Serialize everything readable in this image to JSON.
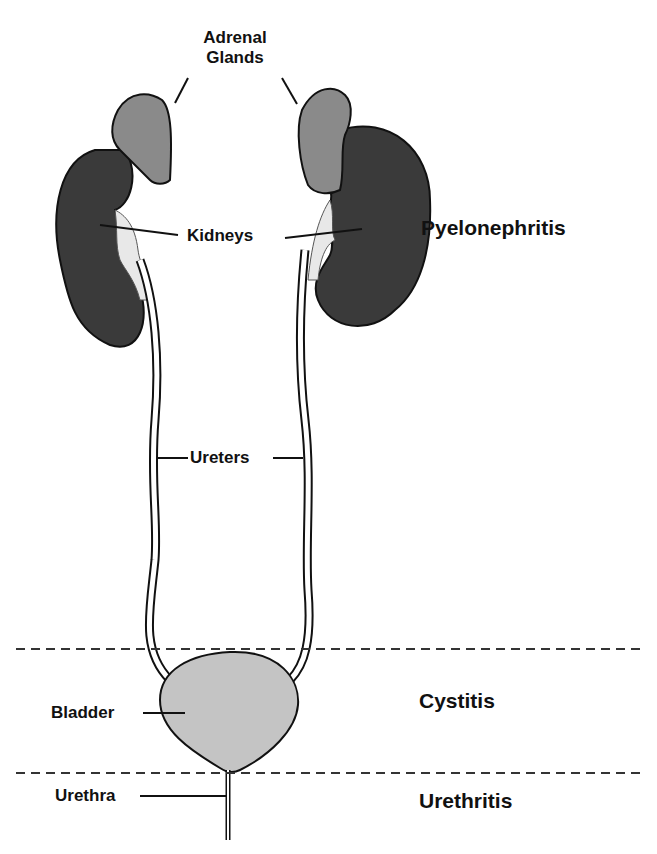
{
  "labels": {
    "adrenal_line1": "Adrenal",
    "adrenal_line2": "Glands",
    "kidneys": "Kidneys",
    "ureters": "Ureters",
    "bladder": "Bladder",
    "urethra": "Urethra"
  },
  "conditions": {
    "upper": "Pyelonephritis",
    "middle": "Cystitis",
    "lower": "Urethritis"
  },
  "colors": {
    "kidney": "#3a3a3a",
    "adrenal": "#8a8a8a",
    "bladder": "#c4c4c4",
    "outline": "#111111",
    "dashed_line": "#333333"
  }
}
